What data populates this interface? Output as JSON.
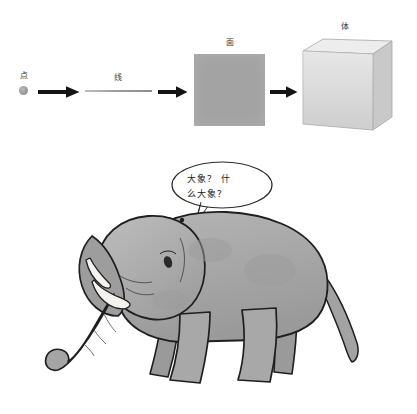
{
  "page": {
    "background_color": "#ffffff"
  },
  "diagram": {
    "name": "point-line-plane-solid-progression",
    "stages": [
      {
        "id": "point",
        "label": "点",
        "shape": "dot",
        "color": "#9a9a9a"
      },
      {
        "id": "line",
        "label": "线",
        "shape": "line",
        "color": "#9e9e9e"
      },
      {
        "id": "plane",
        "label": "面",
        "shape": "square",
        "color": "#a3a3a3"
      },
      {
        "id": "solid",
        "label": "体",
        "shape": "cube",
        "color": "#dcdcdc"
      }
    ],
    "arrows": [
      {
        "id": "arrow-1",
        "from": "point",
        "to": "line",
        "color": "#141414"
      },
      {
        "id": "arrow-2",
        "from": "line",
        "to": "plane",
        "color": "#141414"
      },
      {
        "id": "arrow-3",
        "from": "plane",
        "to": "solid",
        "color": "#141414"
      }
    ],
    "cube": {
      "front_color": "#d9d9d9",
      "side_color": "#c4c4c4",
      "top_color": "#ececec",
      "outline_color": "#9d9d9d"
    }
  },
  "illustration": {
    "name": "cartoon-elephant",
    "speech_bubble": {
      "text": "大象？ 什\n么大象？",
      "fill_color": "#ffffff",
      "outline_color": "#2b2b2b"
    },
    "elephant": {
      "body_color": "#a8a8a8",
      "shade_color": "#949494",
      "outline_color": "#1f1f1f",
      "tusk_color": "#f2f0ea",
      "eye_color": "#2a2a2a"
    }
  }
}
